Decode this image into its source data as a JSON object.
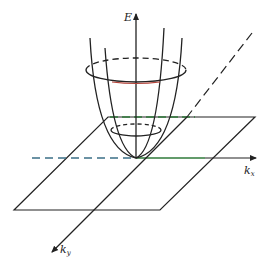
{
  "diagram": {
    "axes": {
      "energy": {
        "label": "E"
      },
      "kx": {
        "label": "k",
        "subscript": "x"
      },
      "ky": {
        "label": "k",
        "subscript": "y"
      }
    },
    "colors": {
      "line": "#222222",
      "dash_blue": "#3b6f86",
      "green": "#2f7a3a",
      "red": "#b5443a"
    }
  }
}
